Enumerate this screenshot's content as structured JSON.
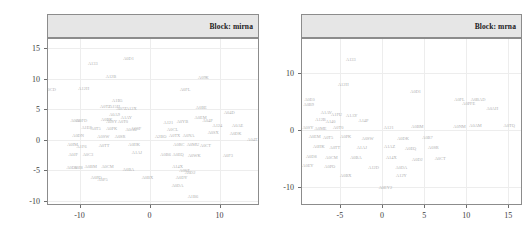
{
  "figure": {
    "type": "faceted-text-scatter",
    "panel_count": 2,
    "point_glyph": "sample-id-text",
    "background": "#ffffff",
    "gridline_color": "#ededed",
    "strip_fill": "#e6e6e6",
    "text_color": "#b0b0b0"
  },
  "chart_data": [
    {
      "type": "scatter",
      "title": "Block: mirna",
      "strip_label": "Block: mirna",
      "xlabel": "",
      "ylabel": "",
      "xlim": [
        -14.5,
        15.5
      ],
      "ylim": [
        -10.5,
        16.5
      ],
      "xticks": [
        -10,
        0,
        10
      ],
      "xticklabels": [
        "-10",
        "0",
        "10"
      ],
      "yticks": [
        -10,
        -5,
        0,
        5,
        10,
        15
      ],
      "yticklabels": [
        "-10",
        "-5",
        "0",
        "5",
        "10",
        "15"
      ],
      "grid": true,
      "legend": "none",
      "labels_as_points": true,
      "points": [
        {
          "label": "A0D1",
          "x": -3.0,
          "y": 13.3
        },
        {
          "label": "A133",
          "x": -8.1,
          "y": 12.4
        },
        {
          "label": "A12B",
          "x": -5.5,
          "y": 10.3
        },
        {
          "label": "A09K",
          "x": 7.7,
          "y": 10.2
        },
        {
          "label": "A12H",
          "x": -9.4,
          "y": 8.3
        },
        {
          "label": "A0CD",
          "x": -14.2,
          "y": 8.2
        },
        {
          "label": "A0FL",
          "x": 5.1,
          "y": 8.1
        },
        {
          "label": "A1B5",
          "x": -4.6,
          "y": 6.4
        },
        {
          "label": "A0TZ",
          "x": -6.3,
          "y": 5.3
        },
        {
          "label": "A15H",
          "x": -5.0,
          "y": 5.3
        },
        {
          "label": "A07Z",
          "x": -4.0,
          "y": 5.0
        },
        {
          "label": "A12X",
          "x": -2.6,
          "y": 5.0
        },
        {
          "label": "A0BE",
          "x": 7.4,
          "y": 5.2
        },
        {
          "label": "A04D",
          "x": 11.4,
          "y": 4.4
        },
        {
          "label": "A0EM",
          "x": 7.3,
          "y": 3.5
        },
        {
          "label": "A04P",
          "x": 8.3,
          "y": 3.1
        },
        {
          "label": "A0A9",
          "x": -5.0,
          "y": 4.0
        },
        {
          "label": "A1AY",
          "x": -3.3,
          "y": 3.6
        },
        {
          "label": "A060",
          "x": -10.6,
          "y": 3.1
        },
        {
          "label": "A0FD",
          "x": -9.7,
          "y": 3.1
        },
        {
          "label": "A0BK",
          "x": -6.1,
          "y": 3.2
        },
        {
          "label": "A0SY",
          "x": -5.4,
          "y": 2.9
        },
        {
          "label": "A0T0",
          "x": -3.8,
          "y": 2.9
        },
        {
          "label": "A121",
          "x": 2.7,
          "y": 2.8
        },
        {
          "label": "A0YB",
          "x": 4.7,
          "y": 2.9
        },
        {
          "label": "A124",
          "x": 9.7,
          "y": 2.3
        },
        {
          "label": "A0AE",
          "x": 12.6,
          "y": 2.2
        },
        {
          "label": "A1E8",
          "x": -9.0,
          "y": 2.0
        },
        {
          "label": "A0T5",
          "x": -7.7,
          "y": 1.7
        },
        {
          "label": "A0PK",
          "x": -5.4,
          "y": 1.7
        },
        {
          "label": "A0AU",
          "x": -2.6,
          "y": 1.6
        },
        {
          "label": "A0SF",
          "x": -1.9,
          "y": 1.8
        },
        {
          "label": "A0CL",
          "x": 3.3,
          "y": 1.6
        },
        {
          "label": "A0SX",
          "x": 9.1,
          "y": 1.2
        },
        {
          "label": "A0DK",
          "x": 12.3,
          "y": 0.9
        },
        {
          "label": "A0DN",
          "x": -10.2,
          "y": 0.6
        },
        {
          "label": "A0SW",
          "x": -6.6,
          "y": 0.5
        },
        {
          "label": "A0SR",
          "x": -4.2,
          "y": 0.4
        },
        {
          "label": "A2BO",
          "x": 1.6,
          "y": 0.5
        },
        {
          "label": "A0TX",
          "x": 3.6,
          "y": 0.6
        },
        {
          "label": "A0NA",
          "x": 5.6,
          "y": 0.6
        },
        {
          "label": "A04T",
          "x": 14.7,
          "y": 0.0
        },
        {
          "label": "A0IM",
          "x": -11.0,
          "y": -0.9
        },
        {
          "label": "A1F6",
          "x": -9.7,
          "y": -1.2
        },
        {
          "label": "A0TT",
          "x": -6.5,
          "y": -1.0
        },
        {
          "label": "A0HK",
          "x": -2.2,
          "y": -0.9
        },
        {
          "label": "A0RC",
          "x": 4.2,
          "y": -0.8
        },
        {
          "label": "A0MU",
          "x": 6.2,
          "y": -0.9
        },
        {
          "label": "A0CT",
          "x": 8.0,
          "y": -1.0
        },
        {
          "label": "A0JF",
          "x": -10.9,
          "y": -2.5
        },
        {
          "label": "A0C3",
          "x": -8.8,
          "y": -2.4
        },
        {
          "label": "A1AJ",
          "x": -1.8,
          "y": -2.2
        },
        {
          "label": "A0B6",
          "x": 2.3,
          "y": -2.4
        },
        {
          "label": "A0EQ",
          "x": 4.1,
          "y": -2.5
        },
        {
          "label": "A0WK",
          "x": 6.4,
          "y": -2.6
        },
        {
          "label": "A0F3",
          "x": 11.2,
          "y": -2.6
        },
        {
          "label": "A0D8",
          "x": -11.1,
          "y": -4.6
        },
        {
          "label": "A0I8",
          "x": -10.2,
          "y": -4.6
        },
        {
          "label": "A0BM",
          "x": -8.4,
          "y": -4.5
        },
        {
          "label": "A0CM",
          "x": -6.0,
          "y": -4.4
        },
        {
          "label": "A0BA",
          "x": -3.0,
          "y": -4.9
        },
        {
          "label": "A14X",
          "x": 4.0,
          "y": -4.5
        },
        {
          "label": "A0D2",
          "x": 5.8,
          "y": -5.4
        },
        {
          "label": "A0SZ",
          "x": 5.0,
          "y": -5.1
        },
        {
          "label": "A0PO",
          "x": -7.6,
          "y": -6.2
        },
        {
          "label": "A0P5",
          "x": -6.7,
          "y": -6.5
        },
        {
          "label": "A0BX",
          "x": -0.3,
          "y": -6.3
        },
        {
          "label": "A0DY",
          "x": 4.6,
          "y": -6.3
        },
        {
          "label": "A0DA",
          "x": 4.0,
          "y": -7.6
        },
        {
          "label": "A1B6",
          "x": 6.2,
          "y": -9.4
        }
      ]
    },
    {
      "type": "scatter",
      "title": "Block: mrna",
      "strip_label": "Block: mrna",
      "xlabel": "",
      "ylabel": "",
      "xlim": [
        -9.5,
        16.5
      ],
      "ylim": [
        -13.0,
        16.0
      ],
      "xticks": [
        -5,
        0,
        5,
        10,
        15
      ],
      "xticklabels": [
        "-5",
        "0",
        "5",
        "10",
        "15"
      ],
      "yticks": [
        -10,
        0,
        10
      ],
      "yticklabels": [
        "-10",
        "0",
        "10"
      ],
      "grid": true,
      "legend": "none",
      "labels_as_points": true,
      "points": [
        {
          "label": "A133",
          "x": -3.7,
          "y": 12.3
        },
        {
          "label": "A12H",
          "x": -4.6,
          "y": 8.0
        },
        {
          "label": "A0D1",
          "x": 4.0,
          "y": 6.7
        },
        {
          "label": "A0E0",
          "x": -8.6,
          "y": 5.2
        },
        {
          "label": "A0B9",
          "x": -8.7,
          "y": 4.4
        },
        {
          "label": "A0FL",
          "x": 9.2,
          "y": 5.3
        },
        {
          "label": "A0BAD",
          "x": 11.4,
          "y": 5.3
        },
        {
          "label": "A0PFE",
          "x": 10.3,
          "y": 4.5
        },
        {
          "label": "A0AH",
          "x": 13.1,
          "y": 3.7
        },
        {
          "label": "A1AV",
          "x": -6.6,
          "y": 3.0
        },
        {
          "label": "A1FU",
          "x": -5.4,
          "y": 2.7
        },
        {
          "label": "A1AY",
          "x": -3.6,
          "y": 2.5
        },
        {
          "label": "A12B",
          "x": -7.3,
          "y": 1.7
        },
        {
          "label": "A140",
          "x": -6.1,
          "y": 1.4
        },
        {
          "label": "A14P",
          "x": -2.2,
          "y": 1.6
        },
        {
          "label": "A0TQ",
          "x": 15.1,
          "y": 0.7
        },
        {
          "label": "A0SY",
          "x": -8.8,
          "y": 0.4
        },
        {
          "label": "A0ME",
          "x": -7.3,
          "y": 0.2
        },
        {
          "label": "A0T0",
          "x": -5.2,
          "y": 0.3
        },
        {
          "label": "A121",
          "x": 0.8,
          "y": 0.4
        },
        {
          "label": "A0BM",
          "x": 4.2,
          "y": 0.5
        },
        {
          "label": "A0NM",
          "x": 9.2,
          "y": 0.6
        },
        {
          "label": "A0AM",
          "x": 11.1,
          "y": 0.7
        },
        {
          "label": "A0EM",
          "x": -8.0,
          "y": -1.2
        },
        {
          "label": "A0T5",
          "x": -6.4,
          "y": -1.4
        },
        {
          "label": "A0PK",
          "x": -4.3,
          "y": -1.3
        },
        {
          "label": "A0SW",
          "x": -1.7,
          "y": -1.5
        },
        {
          "label": "A0DK",
          "x": 2.5,
          "y": -1.6
        },
        {
          "label": "A0B7",
          "x": 5.4,
          "y": -1.4
        },
        {
          "label": "A0HK",
          "x": -7.5,
          "y": -3.0
        },
        {
          "label": "A0TT",
          "x": -5.6,
          "y": -3.2
        },
        {
          "label": "A1AJ",
          "x": -2.4,
          "y": -3.1
        },
        {
          "label": "A1AZ",
          "x": 0.9,
          "y": -3.0
        },
        {
          "label": "A0EQ",
          "x": 3.4,
          "y": -3.3
        },
        {
          "label": "A0SR",
          "x": 6.1,
          "y": -3.2
        },
        {
          "label": "A0D8",
          "x": -8.4,
          "y": -4.8
        },
        {
          "label": "A0CM",
          "x": -6.0,
          "y": -4.9
        },
        {
          "label": "A0BA",
          "x": -3.1,
          "y": -5.0
        },
        {
          "label": "A14X",
          "x": 1.1,
          "y": -5.0
        },
        {
          "label": "A0D2",
          "x": 4.2,
          "y": -5.2
        },
        {
          "label": "A0CT",
          "x": 6.9,
          "y": -5.1
        },
        {
          "label": "A0EY",
          "x": -8.8,
          "y": -6.4
        },
        {
          "label": "A0PO",
          "x": -6.2,
          "y": -6.5
        },
        {
          "label": "A12D",
          "x": -1.0,
          "y": -6.6
        },
        {
          "label": "A0DA",
          "x": 2.3,
          "y": -6.6
        },
        {
          "label": "A0BX",
          "x": -4.3,
          "y": -8.0
        },
        {
          "label": "A12Y",
          "x": 2.3,
          "y": -8.0
        },
        {
          "label": "A0EY2",
          "x": 0.4,
          "y": -10.2
        }
      ]
    }
  ]
}
